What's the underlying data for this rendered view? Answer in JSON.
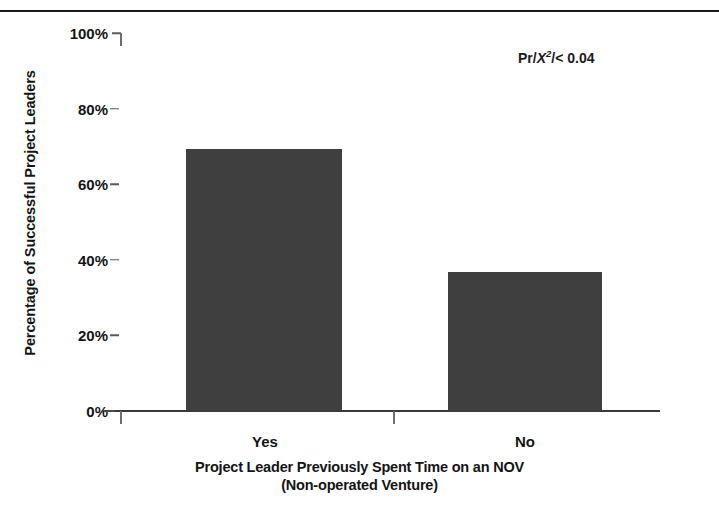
{
  "chart_data": {
    "type": "bar",
    "title": "",
    "categories": [
      "Yes",
      "No"
    ],
    "values": [
      69.3,
      36.8
    ],
    "xlabel": "Project Leader Previously Spent Time on an NOV",
    "xlabel_line2": "(Non-operated Venture)",
    "ylabel": "Percentage of Successful Project Leaders",
    "ylim": [
      0,
      100
    ],
    "yticks": [
      0,
      20,
      40,
      60,
      80,
      100
    ],
    "ytick_labels": [
      "0%",
      "20%",
      "40%",
      "60%",
      "80%",
      "100%"
    ],
    "grid": false,
    "legend": null,
    "bar_color": "#3f3f3f",
    "annotations": [
      {
        "text": "Pr/X2/< 0.04",
        "prefix": "Pr/",
        "symbol": "X",
        "exponent": "2",
        "suffix": "/< 0.04"
      }
    ]
  },
  "figure": {
    "background": "#ffffff",
    "axis_color": "#3a3a3a",
    "text_color": "#141414",
    "top_rule_color": "#1a1a1a"
  }
}
